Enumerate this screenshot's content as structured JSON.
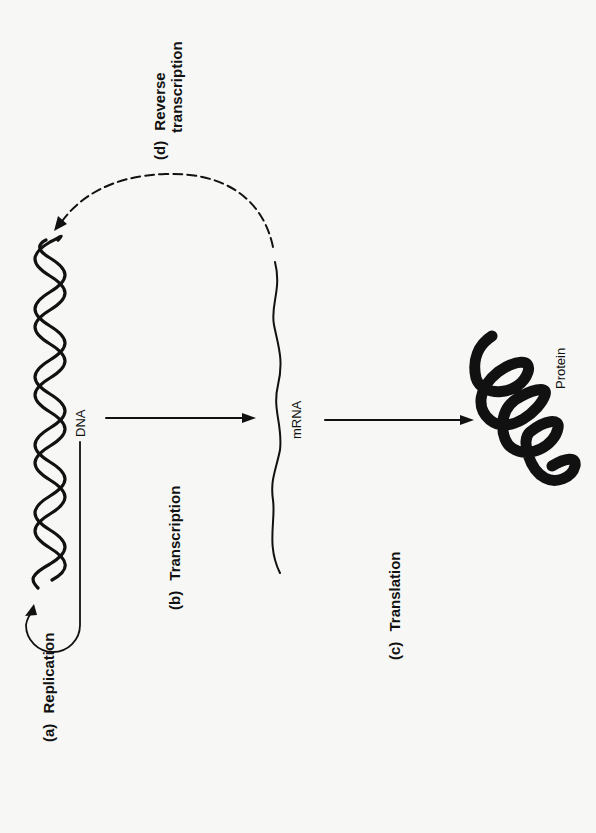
{
  "figure": {
    "orientation": "rotated-90-ccw",
    "background_color": "#f7f7f5",
    "ink_color": "#111111",
    "molecules": {
      "dna": {
        "label": "DNA"
      },
      "mrna": {
        "label": "mRNA"
      },
      "protein": {
        "label": "Protein"
      }
    },
    "processes": {
      "replication": {
        "letter": "(a)",
        "name": "Replication",
        "from": "DNA",
        "to": "DNA",
        "line_style": "solid"
      },
      "transcription": {
        "letter": "(b)",
        "name": "Transcription",
        "from": "DNA",
        "to": "mRNA",
        "line_style": "solid"
      },
      "translation": {
        "letter": "(c)",
        "name": "Translation",
        "from": "mRNA",
        "to": "Protein",
        "line_style": "solid"
      },
      "reverse_transcription": {
        "letter": "(d)",
        "name_line1": "Reverse",
        "name_line2": "transcription",
        "from": "mRNA",
        "to": "DNA",
        "line_style": "dashed"
      }
    }
  }
}
